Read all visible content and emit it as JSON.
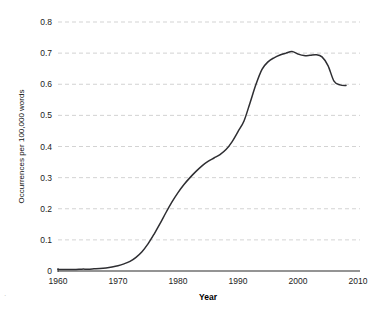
{
  "chart_data": {
    "type": "line",
    "title": "",
    "subtitle": "",
    "xlabel": "Year",
    "ylabel": "Occurrences per 100,000 words",
    "xlim": [
      1960,
      2010
    ],
    "ylim": [
      0,
      0.8
    ],
    "grid": true,
    "legend": false,
    "legend_position": "none",
    "x_ticks": [
      1960,
      1970,
      1980,
      1990,
      2000,
      2010
    ],
    "x_tick_labels": [
      "1960",
      "1970",
      "1980",
      "1990",
      "2000",
      "2010"
    ],
    "y_ticks": [
      0,
      0.1,
      0.2,
      0.3,
      0.4,
      0.5,
      0.6,
      0.7,
      0.8
    ],
    "y_tick_labels": [
      "0",
      "0.1",
      "0.2",
      "0.3",
      "0.4",
      "0.5",
      "0.6",
      "0.7",
      "0.8"
    ],
    "line_color": "#2e2e32",
    "series": [
      {
        "name": "Occurrences per 100,000 words",
        "x": [
          1960,
          1961,
          1962,
          1963,
          1964,
          1965,
          1966,
          1967,
          1968,
          1969,
          1970,
          1971,
          1972,
          1973,
          1974,
          1975,
          1976,
          1977,
          1978,
          1979,
          1980,
          1981,
          1982,
          1983,
          1984,
          1985,
          1986,
          1987,
          1988,
          1989,
          1990,
          1991,
          1992,
          1993,
          1994,
          1995,
          1996,
          1997,
          1998,
          1999,
          2000,
          2001,
          2002,
          2003,
          2004,
          2005,
          2006,
          2007,
          2008
        ],
        "values": [
          0.005,
          0.005,
          0.005,
          0.005,
          0.006,
          0.006,
          0.007,
          0.008,
          0.01,
          0.013,
          0.017,
          0.023,
          0.031,
          0.044,
          0.062,
          0.087,
          0.118,
          0.152,
          0.188,
          0.222,
          0.252,
          0.278,
          0.3,
          0.32,
          0.338,
          0.352,
          0.363,
          0.374,
          0.39,
          0.415,
          0.448,
          0.482,
          0.54,
          0.6,
          0.648,
          0.672,
          0.685,
          0.694,
          0.7,
          0.705,
          0.697,
          0.692,
          0.693,
          0.695,
          0.688,
          0.66,
          0.61,
          0.598,
          0.596
        ]
      }
    ],
    "annotations": []
  },
  "axis": {
    "x_title": "Year",
    "y_title": "Occurrences per 100,000 words"
  }
}
